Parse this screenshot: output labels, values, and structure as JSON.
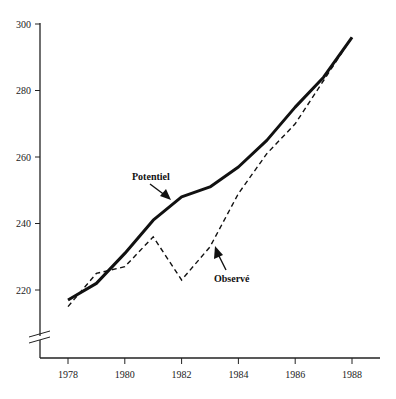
{
  "chart_data": {
    "type": "line",
    "title": "",
    "xlabel": "",
    "ylabel": "",
    "x": [
      1978,
      1979,
      1980,
      1981,
      1982,
      1983,
      1984,
      1985,
      1986,
      1987,
      1988
    ],
    "series": [
      {
        "name": "Potentiel",
        "style": "solid",
        "color": "#111111",
        "values": [
          217,
          222,
          231,
          241,
          248,
          251,
          257,
          265,
          275,
          284,
          296
        ]
      },
      {
        "name": "Observé",
        "style": "dashed",
        "color": "#111111",
        "values": [
          215,
          225,
          227,
          236,
          223,
          233,
          249,
          261,
          270,
          283,
          296
        ]
      }
    ],
    "xticks": [
      "1978",
      "1980",
      "1982",
      "1984",
      "1986",
      "1988"
    ],
    "yticks": [
      "220",
      "240",
      "260",
      "280",
      "300"
    ],
    "ylim": [
      210,
      300
    ],
    "xlim": [
      1977,
      1989
    ],
    "grid": false,
    "y_axis_break": true,
    "annotations": [
      {
        "text": "Potentiel",
        "target_series": "Potentiel",
        "arrow": true
      },
      {
        "text": "Observé",
        "target_series": "Observé",
        "arrow": true
      }
    ]
  },
  "labels": {
    "potentiel": "Potentiel",
    "observe": "Observé"
  }
}
